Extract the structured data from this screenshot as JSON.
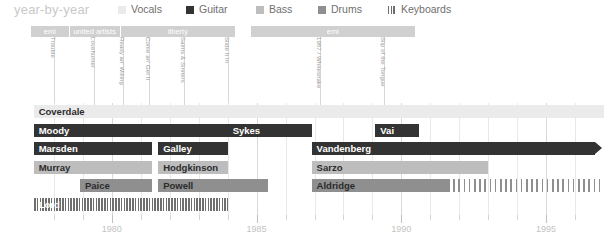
{
  "header": {
    "title": "year-by-year",
    "legend": [
      {
        "label": "Vocals",
        "color": "#ebebeb",
        "pattern": "solid",
        "x": 118
      },
      {
        "label": "Guitar",
        "color": "#333333",
        "pattern": "solid",
        "x": 186
      },
      {
        "label": "Bass",
        "color": "#bdbdbd",
        "pattern": "solid",
        "x": 256
      },
      {
        "label": "Drums",
        "color": "#8f8f8f",
        "pattern": "solid",
        "x": 318
      },
      {
        "label": "Keyboards",
        "color": "#6e6e6e",
        "pattern": "striped",
        "x": 388
      }
    ]
  },
  "record_labels": [
    {
      "name": "emi",
      "start": 1977.2,
      "end": 1978.55
    },
    {
      "name": "united artists",
      "start": 1978.55,
      "end": 1980.3
    },
    {
      "name": "liberty",
      "start": 1980.3,
      "end": 1984.3
    },
    {
      "name": "emi",
      "start": 1984.8,
      "end": 1990.5
    }
  ],
  "albums": [
    {
      "name": "Trouble",
      "year": 1978.0
    },
    {
      "name": "Lovehunter",
      "year": 1979.4
    },
    {
      "name": "Ready an' Willing",
      "year": 1980.4
    },
    {
      "name": "Come an' Get It",
      "year": 1981.3
    },
    {
      "name": "Saints & Sinners",
      "year": 1982.5
    },
    {
      "name": "Slide It In",
      "year": 1984.0
    },
    {
      "name": "1987 / Whitesnake",
      "year": 1987.2
    },
    {
      "name": "Slip of the Tongue",
      "year": 1989.4
    }
  ],
  "chart_data": {
    "type": "bar",
    "title": "year-by-year",
    "xlabel": "",
    "ylabel": "",
    "xlim": [
      1977.0,
      1997.0
    ],
    "grid": true,
    "legend_position": "top",
    "xticks": [
      1978,
      1979,
      1980,
      1981,
      1982,
      1983,
      1984,
      1985,
      1986,
      1987,
      1988,
      1989,
      1990,
      1991,
      1992,
      1993,
      1994,
      1995,
      1996
    ],
    "xtick_labels": [
      "",
      "",
      "1980",
      "",
      "",
      "",
      "",
      "1985",
      "",
      "",
      "",
      "",
      "1990",
      "",
      "",
      "",
      "",
      "1995",
      ""
    ],
    "rows": [
      {
        "row": 0,
        "instrument": "Vocals",
        "segments": [
          {
            "name": "Coverdale",
            "role": "vocals",
            "start": 1977.3,
            "end": 1997.0,
            "label_on": "light",
            "arrow": false
          }
        ]
      },
      {
        "row": 1,
        "instrument": "Guitar",
        "segments": [
          {
            "name": "Moody",
            "role": "guitar",
            "start": 1977.3,
            "end": 1984.0,
            "label_on": "dark",
            "arrow": false
          },
          {
            "name": "Sykes",
            "role": "guitar",
            "start": 1984.0,
            "end": 1986.9,
            "label_on": "dark",
            "arrow": false
          },
          {
            "name": "Vai",
            "role": "guitar",
            "start": 1989.1,
            "end": 1990.6,
            "label_on": "dark",
            "arrow": false
          }
        ]
      },
      {
        "row": 2,
        "instrument": "Guitar",
        "segments": [
          {
            "name": "Marsden",
            "role": "guitar",
            "start": 1977.3,
            "end": 1981.4,
            "label_on": "dark",
            "arrow": false
          },
          {
            "name": "Galley",
            "role": "guitar",
            "start": 1981.6,
            "end": 1984.0,
            "label_on": "dark",
            "arrow": false
          },
          {
            "name": "Vandenberg",
            "role": "guitar",
            "start": 1986.9,
            "end": 1996.7,
            "label_on": "dark",
            "arrow": true
          }
        ]
      },
      {
        "row": 3,
        "instrument": "Bass",
        "segments": [
          {
            "name": "Murray",
            "role": "bass",
            "start": 1977.3,
            "end": 1981.4,
            "label_on": "light",
            "arrow": false
          },
          {
            "name": "Hodgkinson",
            "role": "bass",
            "start": 1981.6,
            "end": 1984.0,
            "label_on": "light",
            "arrow": false
          },
          {
            "name": "Sarzo",
            "role": "bass",
            "start": 1986.9,
            "end": 1993.0,
            "label_on": "light",
            "arrow": false
          }
        ]
      },
      {
        "row": 4,
        "instrument": "Drums",
        "segments": [
          {
            "name": "Paice",
            "role": "drums",
            "start": 1978.9,
            "end": 1981.4,
            "label_on": "light",
            "arrow": false
          },
          {
            "name": "Powell",
            "role": "drums",
            "start": 1981.6,
            "end": 1985.4,
            "label_on": "light",
            "arrow": false
          },
          {
            "name": "Aldridge",
            "role": "drums",
            "start": 1986.9,
            "end": 1991.6,
            "label_on": "light",
            "arrow": false
          },
          {
            "name": "",
            "role": "drums-dashed",
            "start": 1991.6,
            "end": 1996.9,
            "label_on": "light",
            "arrow": false
          }
        ]
      },
      {
        "row": 5,
        "instrument": "Keyboards",
        "segments": [
          {
            "name": "Lord",
            "role": "keys",
            "start": 1977.3,
            "end": 1984.0,
            "label_on": "dark",
            "arrow": false
          }
        ]
      }
    ]
  }
}
